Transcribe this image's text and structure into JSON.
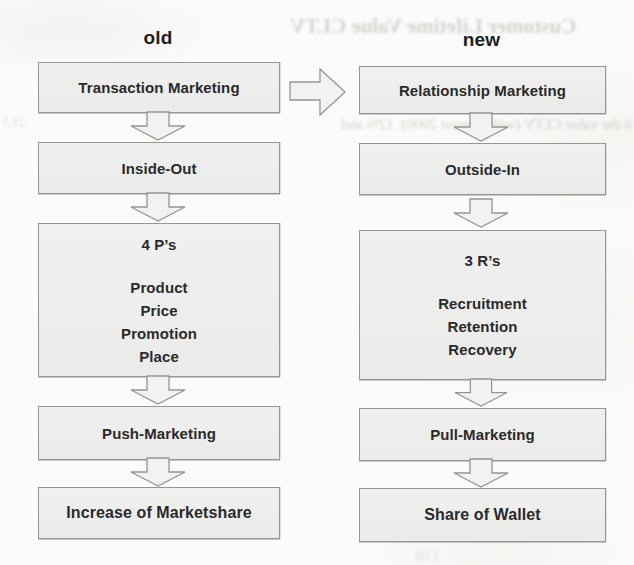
{
  "page": {
    "kind": "scanned book figure",
    "background_color": "#fbfbf9",
    "box_fill": "#eeefec",
    "box_border": "#94968f",
    "text_color": "#2a2a2a"
  },
  "diagram": {
    "columns": [
      {
        "header": "old",
        "boxes": [
          {
            "label": "Transaction Marketing"
          },
          {
            "label": "Inside-Out"
          },
          {
            "label": "4 P’s",
            "items": [
              "Product",
              "Price",
              "Promotion",
              "Place"
            ]
          },
          {
            "label": "Push-Marketing"
          },
          {
            "label": "Increase of Marketshare"
          }
        ]
      },
      {
        "header": "new",
        "boxes": [
          {
            "label": "Relationship Marketing"
          },
          {
            "label": "Outside-In"
          },
          {
            "label": "3 R’s",
            "items": [
              "Recruitment",
              "Retention",
              "Recovery"
            ]
          },
          {
            "label": "Pull-Marketing"
          },
          {
            "label": "Share of Wallet"
          }
        ]
      }
    ],
    "transition_arrow": "old-to-new"
  },
  "scan_artifacts": {
    "note": "faint mirrored bleed-through from reverse page of the scanned book",
    "fragments": [
      {
        "text": "Customer Lifetime Value CLTV"
      },
      {
        "text": "it the value CLTV (with interest 2000): 12% and"
      },
      {
        "text": "21.1"
      },
      {
        "text": "0.5 · 12,000"
      },
      {
        "text": "(1 + 0.08)"
      },
      {
        "text": "506"
      },
      {
        "text": "0.5 · 12,000"
      },
      {
        "text": "152"
      },
      {
        "text": "1.08"
      }
    ]
  }
}
